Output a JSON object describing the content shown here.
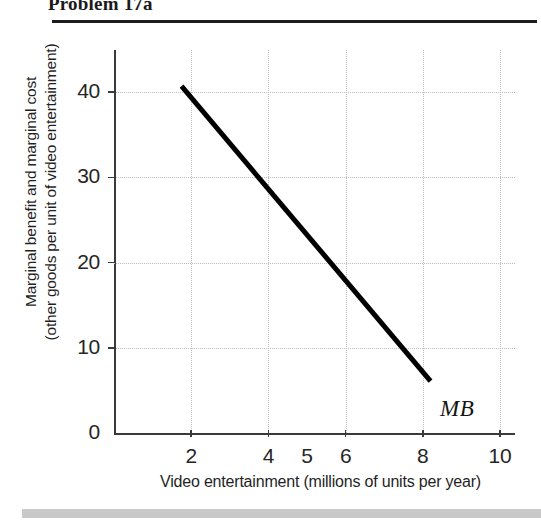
{
  "title": "Problem 17a",
  "chart_data": {
    "type": "line",
    "title": "",
    "xlabel": "Video entertainment (millions of units per year)",
    "ylabel_line1": "Marginal benefit and marginal cost",
    "ylabel_line2": "(other goods per unit of video entertainment)",
    "xlim": [
      0,
      10.4
    ],
    "ylim": [
      0,
      44
    ],
    "x_ticks": [
      2,
      4,
      6,
      8,
      10
    ],
    "x_tick_labels": [
      "2",
      "4",
      "5",
      "6",
      "8",
      "10"
    ],
    "x_label_positions": [
      2,
      4,
      5,
      6,
      8,
      10
    ],
    "y_ticks": [
      0,
      10,
      20,
      30,
      40
    ],
    "y_tick_labels": [
      "0",
      "10",
      "20",
      "30",
      "40"
    ],
    "grid": "dotted",
    "legend": "inline-annotation",
    "series": [
      {
        "name": "MB",
        "annotation": "MB",
        "color": "#000000",
        "linewidth": 5,
        "points": [
          {
            "x": 1.75,
            "y": 40.7
          },
          {
            "x": 8.2,
            "y": 6.1
          }
        ]
      }
    ]
  }
}
